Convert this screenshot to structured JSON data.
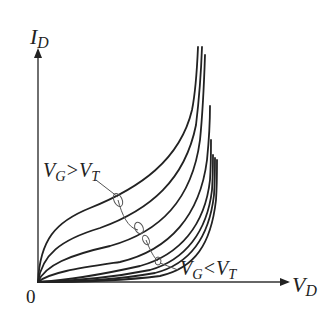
{
  "diagram": {
    "type": "MOSFET drain characteristic sketch",
    "axes": {
      "y_label": {
        "main": "I",
        "sub": "D"
      },
      "x_label": {
        "main": "V",
        "sub": "D"
      },
      "origin_label": "0"
    },
    "annotations": {
      "upper": {
        "left_main": "V",
        "left_sub": "G",
        "operator": ">",
        "right_main": "V",
        "right_sub": "T"
      },
      "lower": {
        "left_main": "V",
        "left_sub": "G",
        "operator": "<",
        "right_main": "V",
        "right_sub": "T"
      }
    },
    "curve_count": 8,
    "colors": {
      "line": "#222222",
      "background": "#ffffff"
    }
  }
}
